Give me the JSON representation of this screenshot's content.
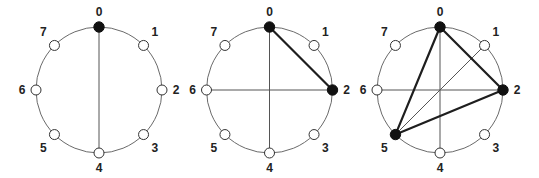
{
  "figure": {
    "node_labels": [
      "0",
      "1",
      "2",
      "3",
      "4",
      "5",
      "6",
      "7"
    ],
    "colors": {
      "circle": "#6a6a6a",
      "thin_line": "#555555",
      "thick_line": "#1e1e1e",
      "filled_node": "#111111",
      "open_node_fill": "#ffffff"
    },
    "panels": [
      {
        "name": "panel-1",
        "center": [
          99,
          90
        ],
        "radius": 63,
        "filled_nodes": [
          0
        ],
        "thin_lines": [
          [
            0,
            4
          ]
        ],
        "thick_lines": []
      },
      {
        "name": "panel-2",
        "center": [
          269.5,
          90
        ],
        "radius": 63,
        "filled_nodes": [
          0,
          2
        ],
        "thin_lines": [
          [
            0,
            4
          ],
          [
            6,
            2
          ]
        ],
        "thick_lines": [
          [
            0,
            2
          ]
        ]
      },
      {
        "name": "panel-3",
        "center": [
          440,
          90
        ],
        "radius": 63,
        "filled_nodes": [
          0,
          2,
          5
        ],
        "thin_lines": [
          [
            0,
            4
          ],
          [
            6,
            2
          ],
          [
            5,
            1
          ]
        ],
        "thick_lines": [
          [
            0,
            2
          ],
          [
            2,
            5
          ],
          [
            5,
            0
          ]
        ]
      }
    ]
  }
}
